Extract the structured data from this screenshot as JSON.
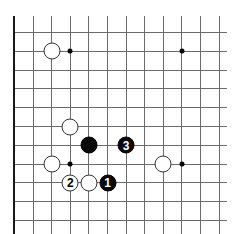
{
  "diagram": {
    "type": "go-board-fragment",
    "colors": {
      "line": "#6a6a6a",
      "edge": "#1a1a1a",
      "black": "#0a0a0a",
      "white": "#ffffff"
    },
    "grid": {
      "origin_x": 14,
      "origin_y": 32,
      "top_y": 16,
      "right_x": 227,
      "dx": 18.6,
      "dy": 18.8,
      "cols": 12,
      "rows": 11
    },
    "edges": [
      "left",
      "bottom"
    ],
    "star_points": [
      {
        "col": 3,
        "row": 1
      },
      {
        "col": 9,
        "row": 1
      },
      {
        "col": 3,
        "row": 7
      },
      {
        "col": 9,
        "row": 7
      }
    ],
    "stones": [
      {
        "color": "white",
        "col": 2,
        "row": 1,
        "label": ""
      },
      {
        "color": "white",
        "col": 3,
        "row": 5,
        "label": ""
      },
      {
        "color": "black",
        "col": 4,
        "row": 6,
        "label": ""
      },
      {
        "color": "black",
        "col": 6,
        "row": 6,
        "label": "3"
      },
      {
        "color": "white",
        "col": 2,
        "row": 7,
        "label": ""
      },
      {
        "color": "white",
        "col": 8,
        "row": 7,
        "label": ""
      },
      {
        "color": "white",
        "col": 3,
        "row": 8,
        "label": "2"
      },
      {
        "color": "white",
        "col": 4,
        "row": 8,
        "label": ""
      },
      {
        "color": "black",
        "col": 5,
        "row": 8,
        "label": "1"
      }
    ]
  }
}
